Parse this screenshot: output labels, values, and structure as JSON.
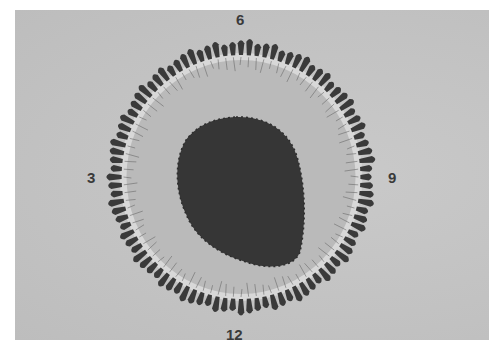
{
  "figure": {
    "type": "photograph",
    "tone": "grayscale",
    "colors": {
      "background": "#c4c4c4",
      "inner_disc": "#bababa",
      "pale_band": "#d8d8d8",
      "petals": "#3a3a3a",
      "central_mass": "#363636",
      "label": "#3a3a3a"
    },
    "ring": {
      "center": [
        241,
        177
      ],
      "outer_radius_x": 138,
      "outer_radius_y": 141,
      "petal_inner_radius": 122,
      "inner_disc_radius": 117,
      "petal_count": 96
    },
    "central_mass": {
      "bbox": [
        175,
        116,
        305,
        268
      ]
    }
  },
  "clock_labels": [
    {
      "text": "6",
      "position": "top",
      "x": 236,
      "y": 12
    },
    {
      "text": "3",
      "position": "left",
      "x": 87,
      "y": 170
    },
    {
      "text": "9",
      "position": "right",
      "x": 388,
      "y": 170
    },
    {
      "text": "12",
      "position": "bottom",
      "x": 226,
      "y": 327
    }
  ]
}
